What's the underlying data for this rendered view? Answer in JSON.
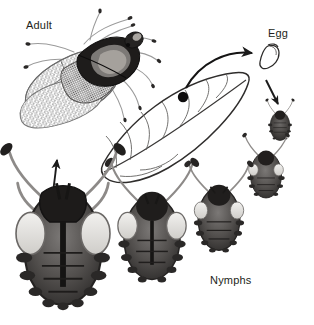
{
  "figure": {
    "kind": "life-cycle-diagram",
    "background_color": "#ffffff",
    "ink_color": "#231f20",
    "line_color": "#3b3b3b"
  },
  "labels": {
    "adult": "Adult",
    "egg": "Egg",
    "nymphs": "Nymphs"
  },
  "stages": [
    {
      "id": "adult",
      "label": "Adult",
      "description": "Winged adult lace bug with reticulated lacy forewings, dark pronotum, long legs and antennae",
      "position": "top-left"
    },
    {
      "id": "egg",
      "label": "Egg",
      "description": "Single curved egg inserted in leaf tissue",
      "position": "top-right"
    },
    {
      "id": "nymph-1",
      "label": "Nymphs",
      "description": "First instar nymph, smallest, dark body",
      "position": "right"
    },
    {
      "id": "nymph-2",
      "label": "Nymphs",
      "description": "Second instar nymph, spined abdomen",
      "position": "right-lower"
    },
    {
      "id": "nymph-3",
      "label": "Nymphs",
      "description": "Third instar nymph with longer antennae and spines",
      "position": "bottom-center-right"
    },
    {
      "id": "nymph-4",
      "label": "Nymphs",
      "description": "Fourth instar nymph with developing wing pads",
      "position": "bottom-center"
    },
    {
      "id": "nymph-5",
      "label": "Nymphs",
      "description": "Fifth instar nymph, largest, prominent wing pads",
      "position": "bottom-left"
    }
  ],
  "leaf": {
    "description": "Host leaf with midrib and lateral veins; dark spot marks feeding/egg site",
    "spot": "egg-laying site"
  },
  "arrows": [
    {
      "id": "leaf-to-egg",
      "from": "leaf",
      "to": "egg",
      "style": "curved"
    },
    {
      "id": "egg-to-nymph1",
      "from": "egg",
      "to": "nymph-1",
      "style": "straight"
    },
    {
      "id": "nymph5-to-adult",
      "from": "nymph-5",
      "to": "adult",
      "style": "straight"
    }
  ]
}
